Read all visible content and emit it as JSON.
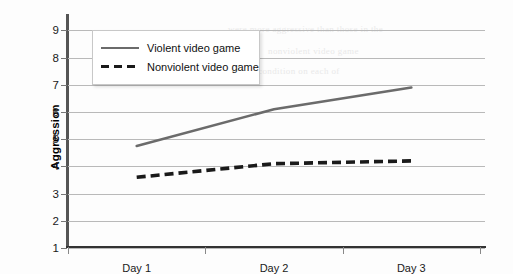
{
  "chart_data": {
    "type": "line",
    "title": "",
    "xlabel": "",
    "ylabel": "Aggression",
    "categories": [
      "Day 1",
      "Day 2",
      "Day 3"
    ],
    "ylim": [
      1,
      9.6
    ],
    "yticks": [
      1,
      2,
      3,
      4,
      5,
      6,
      7,
      8,
      9
    ],
    "grid": true,
    "legend_position": "top-left",
    "series": [
      {
        "name": "Violent video game",
        "style": "solid",
        "color": "#6b6b6b",
        "values": [
          4.75,
          6.1,
          6.9
        ]
      },
      {
        "name": "Nonviolent video game",
        "style": "dashed",
        "color": "#1a1a1a",
        "values": [
          3.6,
          4.1,
          4.2
        ]
      }
    ]
  },
  "axis": {
    "y_title": "Aggression",
    "y_tick_labels": [
      "9",
      "8",
      "7",
      "6",
      "5",
      "4",
      "3",
      "2",
      "1"
    ],
    "x_tick_labels": [
      "Day 1",
      "Day 2",
      "Day 3"
    ]
  },
  "legend": {
    "items": [
      {
        "label": "Violent video game",
        "swatch": "solid-line-swatch"
      },
      {
        "label": "Nonviolent video game",
        "swatch": "dashed-line-swatch"
      }
    ]
  },
  "artifacts": {
    "bleed_lines": [
      "were more aggressive than those in the",
      "nonviolent video game",
      "condition on each of"
    ]
  }
}
